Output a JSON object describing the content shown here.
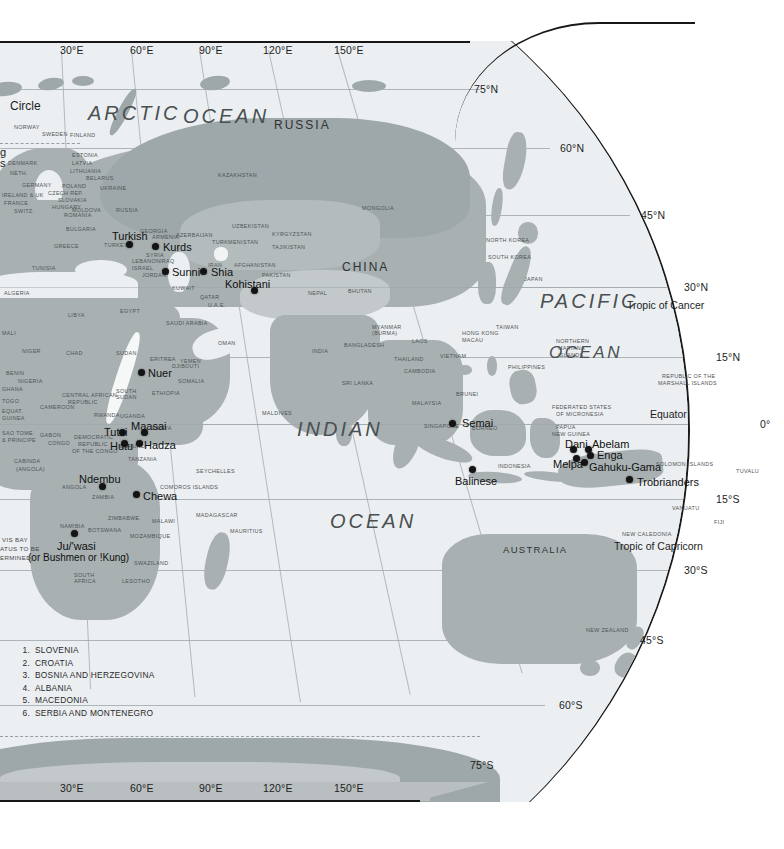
{
  "map": {
    "title": "World cultures reference map — Eastern Hemisphere",
    "oceans": [
      {
        "name": "ARCTIC",
        "x": 88,
        "y": 75
      },
      {
        "name": "OCEAN",
        "x": 183,
        "y": 78
      },
      {
        "name": "PACIFIC",
        "x": 540,
        "y": 298
      },
      {
        "name": "OCEAN",
        "x": 549,
        "y": 348
      },
      {
        "name": "INDIAN",
        "x": 297,
        "y": 426
      },
      {
        "name": "OCEAN",
        "x": 330,
        "y": 518
      }
    ],
    "latitude_labels": [
      {
        "text": "75°N",
        "x": 474,
        "y": 89
      },
      {
        "text": "60°N",
        "x": 560,
        "y": 148
      },
      {
        "text": "45°N",
        "x": 641,
        "y": 215
      },
      {
        "text": "30°N",
        "x": 684,
        "y": 287
      },
      {
        "text": "15°N",
        "x": 716,
        "y": 357
      },
      {
        "text": "0°",
        "x": 760,
        "y": 424
      },
      {
        "text": "15°S",
        "x": 716,
        "y": 499
      },
      {
        "text": "30°S",
        "x": 684,
        "y": 570
      },
      {
        "text": "45°S",
        "x": 640,
        "y": 640
      },
      {
        "text": "60°S",
        "x": 559,
        "y": 705
      },
      {
        "text": "75°S",
        "x": 470,
        "y": 765
      }
    ],
    "longitude_labels_top": [
      {
        "text": "30°E",
        "x": 60
      },
      {
        "text": "60°E",
        "x": 130
      },
      {
        "text": "90°E",
        "x": 199
      },
      {
        "text": "120°E",
        "x": 263
      },
      {
        "text": "150°E",
        "x": 334
      }
    ],
    "longitude_labels_bottom": [
      {
        "text": "30°E",
        "x": 60
      },
      {
        "text": "60°E",
        "x": 130
      },
      {
        "text": "90°E",
        "x": 199
      },
      {
        "text": "120°E",
        "x": 263
      },
      {
        "text": "150°E",
        "x": 334
      }
    ],
    "special_lines": [
      {
        "text": "Tropic of Cancer",
        "x": 627,
        "y": 305
      },
      {
        "text": "Equator",
        "x": 650,
        "y": 414
      },
      {
        "text": "Tropic of Capricorn",
        "x": 614,
        "y": 546
      }
    ],
    "edge_clipped_labels": [
      {
        "text": "Circle",
        "x": 10,
        "y": 105
      },
      {
        "text": "g",
        "x": 0,
        "y": 152
      },
      {
        "text": "s",
        "x": 0,
        "y": 163
      }
    ],
    "major_regions": [
      {
        "text": "RUSSIA",
        "x": 274,
        "y": 118,
        "cls": "bigctry"
      },
      {
        "text": "CHINA",
        "x": 342,
        "y": 260,
        "cls": "bigctry"
      },
      {
        "text": "AUSTRALIA",
        "x": 503,
        "y": 544,
        "cls": "bigctry sm"
      }
    ],
    "countries": [
      {
        "text": "NORWAY",
        "x": 14,
        "y": 124
      },
      {
        "text": "SWEDEN",
        "x": 42,
        "y": 131
      },
      {
        "text": "FINLAND",
        "x": 70,
        "y": 132
      },
      {
        "text": "ESTONIA",
        "x": 72,
        "y": 152
      },
      {
        "text": "LATVIA",
        "x": 72,
        "y": 160
      },
      {
        "text": "LITHUANIA",
        "x": 70,
        "y": 168
      },
      {
        "text": "BELARUS",
        "x": 86,
        "y": 175
      },
      {
        "text": "DENMARK",
        "x": 8,
        "y": 160
      },
      {
        "text": "NETH.",
        "x": 10,
        "y": 170
      },
      {
        "text": "GERMANY",
        "x": 22,
        "y": 182
      },
      {
        "text": "POLAND",
        "x": 62,
        "y": 183
      },
      {
        "text": "IRELAND & UK",
        "x": 2,
        "y": 192
      },
      {
        "text": "FRANCE",
        "x": 4,
        "y": 200
      },
      {
        "text": "SWITZ.",
        "x": 14,
        "y": 208
      },
      {
        "text": "CZECH REP.",
        "x": 48,
        "y": 190
      },
      {
        "text": "SLOVAKIA",
        "x": 58,
        "y": 197
      },
      {
        "text": "HUNGARY",
        "x": 52,
        "y": 204
      },
      {
        "text": "UKRAINE",
        "x": 100,
        "y": 185
      },
      {
        "text": "MOLDOVA",
        "x": 72,
        "y": 207
      },
      {
        "text": "ROMANIA",
        "x": 64,
        "y": 212
      },
      {
        "text": "RUSSIA",
        "x": 116,
        "y": 207
      },
      {
        "text": "BULGARIA",
        "x": 66,
        "y": 226
      },
      {
        "text": "GREECE",
        "x": 54,
        "y": 243
      },
      {
        "text": "TURKEY",
        "x": 104,
        "y": 242
      },
      {
        "text": "KAZAKHSTAN",
        "x": 218,
        "y": 172
      },
      {
        "text": "MONGOLIA",
        "x": 362,
        "y": 205
      },
      {
        "text": "UZBEKISTAN",
        "x": 232,
        "y": 223
      },
      {
        "text": "KYRGYZSTAN",
        "x": 272,
        "y": 231
      },
      {
        "text": "TAJIKISTAN",
        "x": 272,
        "y": 244
      },
      {
        "text": "TURKMENISTAN",
        "x": 212,
        "y": 239
      },
      {
        "text": "AZERBAIJAN",
        "x": 176,
        "y": 232
      },
      {
        "text": "ARMENIA",
        "x": 152,
        "y": 234
      },
      {
        "text": "GEORGIA",
        "x": 140,
        "y": 228
      },
      {
        "text": "AFGHANISTAN",
        "x": 234,
        "y": 262
      },
      {
        "text": "PAKISTAN",
        "x": 262,
        "y": 272
      },
      {
        "text": "IRAN",
        "x": 208,
        "y": 262
      },
      {
        "text": "IRAQ",
        "x": 160,
        "y": 258
      },
      {
        "text": "SYRIA",
        "x": 146,
        "y": 252
      },
      {
        "text": "LEBANON",
        "x": 132,
        "y": 258
      },
      {
        "text": "ISRAEL",
        "x": 132,
        "y": 265
      },
      {
        "text": "JORDAN",
        "x": 142,
        "y": 272
      },
      {
        "text": "KUWAIT",
        "x": 172,
        "y": 285
      },
      {
        "text": "QATAR",
        "x": 200,
        "y": 294
      },
      {
        "text": "U.A.E.",
        "x": 208,
        "y": 302
      },
      {
        "text": "SAUDI ARABIA",
        "x": 166,
        "y": 320
      },
      {
        "text": "OMAN",
        "x": 218,
        "y": 340
      },
      {
        "text": "YEMEN",
        "x": 180,
        "y": 358
      },
      {
        "text": "ERITREA",
        "x": 150,
        "y": 356
      },
      {
        "text": "SUDAN",
        "x": 116,
        "y": 350
      },
      {
        "text": "CHAD",
        "x": 66,
        "y": 350
      },
      {
        "text": "NIGER",
        "x": 22,
        "y": 348
      },
      {
        "text": "LIBYA",
        "x": 68,
        "y": 312
      },
      {
        "text": "EGYPT",
        "x": 120,
        "y": 308
      },
      {
        "text": "ALGERIA",
        "x": 4,
        "y": 290
      },
      {
        "text": "TUNISIA",
        "x": 32,
        "y": 265
      },
      {
        "text": "MALI",
        "x": 2,
        "y": 330
      },
      {
        "text": "NIGERIA",
        "x": 18,
        "y": 378
      },
      {
        "text": "BENIN",
        "x": 6,
        "y": 370
      },
      {
        "text": "TOGO",
        "x": 2,
        "y": 398
      },
      {
        "text": "GHANA",
        "x": 2,
        "y": 386
      },
      {
        "text": "CAMEROON",
        "x": 40,
        "y": 404
      },
      {
        "text": "CENTRAL AFRICAN",
        "x": 62,
        "y": 392
      },
      {
        "text": "REPUBLIC",
        "x": 68,
        "y": 399
      },
      {
        "text": "SOUTH",
        "x": 116,
        "y": 388
      },
      {
        "text": "SUDAN",
        "x": 116,
        "y": 394
      },
      {
        "text": "ETHIOPIA",
        "x": 152,
        "y": 390
      },
      {
        "text": "SOMALIA",
        "x": 178,
        "y": 378
      },
      {
        "text": "DJIBOUTI",
        "x": 172,
        "y": 363
      },
      {
        "text": "EQUAT.",
        "x": 2,
        "y": 408
      },
      {
        "text": "GUINEA",
        "x": 2,
        "y": 415
      },
      {
        "text": "SAO TOME",
        "x": 2,
        "y": 430
      },
      {
        "text": "& PRINCIPE",
        "x": 2,
        "y": 437
      },
      {
        "text": "GABON",
        "x": 40,
        "y": 432
      },
      {
        "text": "CONGO",
        "x": 48,
        "y": 440
      },
      {
        "text": "DEMOCRATIC",
        "x": 74,
        "y": 434
      },
      {
        "text": "REPUBLIC",
        "x": 78,
        "y": 441
      },
      {
        "text": "OF THE CONGO",
        "x": 72,
        "y": 448
      },
      {
        "text": "RWANDA",
        "x": 94,
        "y": 412
      },
      {
        "text": "BURUNDI",
        "x": 120,
        "y": 443
      },
      {
        "text": "UGANDA",
        "x": 120,
        "y": 413
      },
      {
        "text": "KENYA",
        "x": 152,
        "y": 425
      },
      {
        "text": "TANZANIA",
        "x": 128,
        "y": 456
      },
      {
        "text": "CABINDA",
        "x": 14,
        "y": 458
      },
      {
        "text": "(Angola)",
        "x": 16,
        "y": 466
      },
      {
        "text": "ANGOLA",
        "x": 62,
        "y": 484
      },
      {
        "text": "ZAMBIA",
        "x": 92,
        "y": 494
      },
      {
        "text": "ZIMBABWE",
        "x": 108,
        "y": 515
      },
      {
        "text": "MALAWI",
        "x": 152,
        "y": 518
      },
      {
        "text": "MOZAMBIQUE",
        "x": 130,
        "y": 533
      },
      {
        "text": "BOTSWANA",
        "x": 88,
        "y": 527
      },
      {
        "text": "NAMIBIA",
        "x": 60,
        "y": 523
      },
      {
        "text": "SOUTH",
        "x": 74,
        "y": 572
      },
      {
        "text": "AFRICA",
        "x": 74,
        "y": 578
      },
      {
        "text": "SWAZILAND",
        "x": 134,
        "y": 560
      },
      {
        "text": "LESOTHO",
        "x": 122,
        "y": 578
      },
      {
        "text": "MADAGASCAR",
        "x": 196,
        "y": 512
      },
      {
        "text": "MAURITIUS",
        "x": 230,
        "y": 528
      },
      {
        "text": "SEYCHELLES",
        "x": 196,
        "y": 468
      },
      {
        "text": "COMOROS ISLANDS",
        "x": 160,
        "y": 484
      },
      {
        "text": "MALDIVES",
        "x": 262,
        "y": 410
      },
      {
        "text": "INDIA",
        "x": 312,
        "y": 348
      },
      {
        "text": "SRI LANKA",
        "x": 342,
        "y": 380
      },
      {
        "text": "NEPAL",
        "x": 308,
        "y": 290
      },
      {
        "text": "BHUTAN",
        "x": 348,
        "y": 288
      },
      {
        "text": "BANGLADESH",
        "x": 344,
        "y": 342
      },
      {
        "text": "MYANMAR",
        "x": 372,
        "y": 324
      },
      {
        "text": "(BURMA)",
        "x": 372,
        "y": 330
      },
      {
        "text": "THAILAND",
        "x": 394,
        "y": 356
      },
      {
        "text": "LAOS",
        "x": 412,
        "y": 338
      },
      {
        "text": "VIETNAM",
        "x": 440,
        "y": 353
      },
      {
        "text": "CAMBODIA",
        "x": 404,
        "y": 368
      },
      {
        "text": "NORTH KOREA",
        "x": 486,
        "y": 237
      },
      {
        "text": "SOUTH KOREA",
        "x": 488,
        "y": 254
      },
      {
        "text": "JAPAN",
        "x": 524,
        "y": 276
      },
      {
        "text": "TAIWAN",
        "x": 496,
        "y": 324
      },
      {
        "text": "HONG KONG",
        "x": 462,
        "y": 330
      },
      {
        "text": "MACAU",
        "x": 462,
        "y": 337
      },
      {
        "text": "PHILIPPINES",
        "x": 508,
        "y": 364
      },
      {
        "text": "MALAYSIA",
        "x": 412,
        "y": 400
      },
      {
        "text": "SINGAPORE",
        "x": 424,
        "y": 423
      },
      {
        "text": "BRUNEI",
        "x": 456,
        "y": 391
      },
      {
        "text": "BORNEO",
        "x": 472,
        "y": 425
      },
      {
        "text": "INDONESIA",
        "x": 498,
        "y": 463
      },
      {
        "text": "PAPUA",
        "x": 556,
        "y": 424
      },
      {
        "text": "NEW GUINEA",
        "x": 552,
        "y": 431
      },
      {
        "text": "NORTHERN",
        "x": 556,
        "y": 338
      },
      {
        "text": "MARIANA",
        "x": 558,
        "y": 345
      },
      {
        "text": "ISLANDS",
        "x": 558,
        "y": 352
      },
      {
        "text": "FEDERATED STATES",
        "x": 552,
        "y": 404
      },
      {
        "text": "OF MICRONESIA",
        "x": 556,
        "y": 411
      },
      {
        "text": "REPUBLIC OF THE",
        "x": 662,
        "y": 373
      },
      {
        "text": "MARSHALL ISLANDS",
        "x": 658,
        "y": 380
      },
      {
        "text": "SOLOMON ISLANDS",
        "x": 656,
        "y": 461
      },
      {
        "text": "TUVALU",
        "x": 736,
        "y": 468
      },
      {
        "text": "VANUATU",
        "x": 672,
        "y": 505
      },
      {
        "text": "FIJI",
        "x": 714,
        "y": 519
      },
      {
        "text": "NEW CALEDONIA",
        "x": 622,
        "y": 531
      },
      {
        "text": "NEW ZEALAND",
        "x": 586,
        "y": 627
      }
    ],
    "culture_groups": [
      {
        "text": "Turkish",
        "lx": 112,
        "ly": 230,
        "dx": 129,
        "dy": 244,
        "cls": "grp"
      },
      {
        "text": "Kurds",
        "lx": 163,
        "ly": 241,
        "dx": 155,
        "dy": 246,
        "cls": "grp"
      },
      {
        "text": "Sunni",
        "lx": 172,
        "ly": 266,
        "dx": 165,
        "dy": 271,
        "cls": "grp"
      },
      {
        "text": "Shia",
        "lx": 211,
        "ly": 266,
        "dx": 203,
        "dy": 271,
        "cls": "grp"
      },
      {
        "text": "Kohistani",
        "lx": 225,
        "ly": 278,
        "dx": 254,
        "dy": 290,
        "cls": "grp"
      },
      {
        "text": "Nuer",
        "lx": 148,
        "ly": 367,
        "dx": 141,
        "dy": 372,
        "cls": "grp"
      },
      {
        "text": "Maasai",
        "lx": 131,
        "ly": 420,
        "dx": 144,
        "dy": 432,
        "cls": "grp"
      },
      {
        "text": "Tutsi",
        "lx": 104,
        "ly": 426,
        "dx": 122,
        "dy": 432,
        "cls": "grp"
      },
      {
        "text": "Hutu",
        "lx": 110,
        "ly": 440,
        "dx": 124,
        "dy": 443,
        "cls": "grp"
      },
      {
        "text": "Hadza",
        "lx": 144,
        "ly": 439,
        "dx": 139,
        "dy": 443,
        "cls": "grp"
      },
      {
        "text": "Ndembu",
        "lx": 79,
        "ly": 473,
        "dx": 102,
        "dy": 486,
        "cls": "grp"
      },
      {
        "text": "Chewa",
        "lx": 143,
        "ly": 490,
        "dx": 136,
        "dy": 494,
        "cls": "grp"
      },
      {
        "text": "Ju/'wasi",
        "lx": 57,
        "ly": 540,
        "dx": 74,
        "dy": 533,
        "cls": "grp"
      },
      {
        "text": "(or Bushmen or !Kung)",
        "lx": 28,
        "ly": 552,
        "cls": "grp paren"
      },
      {
        "text": "Semai",
        "lx": 462,
        "ly": 417,
        "dx": 452,
        "dy": 423,
        "cls": "grp"
      },
      {
        "text": "Balinese",
        "lx": 455,
        "ly": 475,
        "dx": 472,
        "dy": 469,
        "cls": "grp"
      },
      {
        "text": "Dani",
        "lx": 565,
        "ly": 438,
        "dx": 573,
        "dy": 449,
        "cls": "grp"
      },
      {
        "text": "Abelam",
        "lx": 592,
        "ly": 438,
        "dx": 588,
        "dy": 449,
        "cls": "grp"
      },
      {
        "text": "Enga",
        "lx": 597,
        "ly": 449,
        "dx": 590,
        "dy": 455,
        "cls": "grp"
      },
      {
        "text": "Melpa",
        "lx": 553,
        "ly": 458,
        "dx": 576,
        "dy": 458,
        "cls": "grp"
      },
      {
        "text": "Gahuku-Gama",
        "lx": 589,
        "ly": 461,
        "dx": 584,
        "dy": 462,
        "cls": "grp"
      },
      {
        "text": "Trobrianders",
        "lx": 637,
        "ly": 476,
        "dx": 629,
        "dy": 479,
        "cls": "grp"
      }
    ],
    "clipped_note": [
      {
        "text": "VIS BAY",
        "x": 2,
        "y": 536
      },
      {
        "text": "atus to be",
        "x": 0,
        "y": 545
      },
      {
        "text": "ermined)",
        "x": 0,
        "y": 554
      }
    ],
    "legend": [
      {
        "num": "1.",
        "label": "SLOVENIA"
      },
      {
        "num": "2.",
        "label": "CROATIA"
      },
      {
        "num": "3.",
        "label": "BOSNIA AND HERZEGOVINA"
      },
      {
        "num": "4.",
        "label": "ALBANIA"
      },
      {
        "num": "5.",
        "label": "MACEDONIA"
      },
      {
        "num": "6.",
        "label": "SERBIA AND MONTENEGRO"
      }
    ],
    "colors": {
      "ocean": "#eceff1",
      "land": "#a8b0b2",
      "graticule": "#9aa2a6",
      "outline": "#1a1a1a",
      "text": "#2b2b2b",
      "marker": "#141414",
      "band": "#b9bfc0"
    }
  }
}
